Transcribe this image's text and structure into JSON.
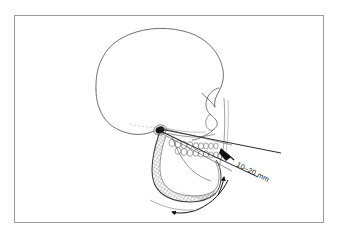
{
  "figure": {
    "kind": "anatomical-line-drawing",
    "background_color": "#ffffff",
    "border_color": "#9a9a9a",
    "ink_color": "#1a1a1a",
    "outline_color": "#555555",
    "hatch_color": "#707070"
  },
  "annotations": {
    "measurement_label": "10–20 mm",
    "measurement_value_min": 10,
    "measurement_value_max": 20,
    "measurement_unit": "mm",
    "label_rotation_deg": 27
  },
  "parts": {
    "cranium": "cranial-vault-outline",
    "nose": "nasal-profile-outline",
    "maxilla": "maxilla-outline",
    "mandible": "mandible-outline",
    "condyle": "temporomandibular-condyle",
    "upper_teeth": "maxillary-dentition",
    "lower_teeth": "mandibular-dentition",
    "ramus_shading": "mandibular-ramus-hatching",
    "guide_line_upper": "opening-guide-line-upper",
    "guide_line_lower": "opening-guide-line-lower",
    "motion_arrow_anterior": "mandible-motion-arrow-anterior",
    "motion_arrow_inferior": "mandible-motion-arrow-inferior",
    "measurement_marker": "interincisal-distance-marker"
  }
}
